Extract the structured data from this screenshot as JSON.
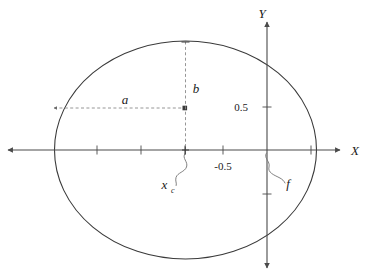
{
  "figure": {
    "kind": "ellipse-geometry-diagram",
    "background_color": "#ffffff",
    "stroke_color": "#3a3a3a",
    "axis_color": "#4a4a4a",
    "dashed_color": "#8a8a8a",
    "text_color": "#1a1a1a",
    "width": 377,
    "height": 277
  },
  "axes": {
    "x_axis": {
      "label": "X",
      "label_x": 355,
      "label_y": 155,
      "y": 150,
      "x_start": 8,
      "x_end": 340,
      "arrow_left": true,
      "arrow_right": true,
      "ticks": [
        97,
        141,
        185,
        223,
        311
      ]
    },
    "y_axis": {
      "label": "Y",
      "label_x": 262,
      "label_y": 18,
      "x": 267,
      "y_start": 22,
      "y_end": 268,
      "arrow_top": true,
      "arrow_bottom": true,
      "ticks": [
        107,
        194
      ]
    },
    "tick_labels": [
      {
        "name": "y-tick-0.5",
        "text": "0.5",
        "x": 248,
        "y": 111,
        "anchor": "end"
      },
      {
        "name": "x-tick-neg-0.5",
        "text": "-0.5",
        "x": 223,
        "y": 170,
        "anchor": "middle"
      }
    ]
  },
  "ellipse": {
    "cx": 185.5,
    "cy": 150,
    "rx": 131,
    "ry": 109,
    "stroke_width": 1.1
  },
  "annotations": {
    "semi_major": {
      "name": "semi-major-axis-a",
      "label": "a",
      "label_x": 125,
      "label_y": 104,
      "line_y": 108,
      "line_x_start": 54,
      "line_x_end": 185.5
    },
    "semi_minor": {
      "name": "semi-minor-axis-b",
      "label": "b",
      "label_x": 196,
      "label_y": 93,
      "line_x": 185.5,
      "line_y_start": 41.5,
      "line_y_end": 150
    },
    "center_x": {
      "name": "center-offset-xc",
      "label": "x",
      "subscript": "c",
      "label_x": 168,
      "label_y": 189,
      "anchor_x": 185.5,
      "anchor_y": 152
    },
    "focus": {
      "name": "focal-distance-f",
      "label": "f",
      "label_x": 288,
      "label_y": 188,
      "anchor_x": 267,
      "anchor_y": 152
    }
  }
}
